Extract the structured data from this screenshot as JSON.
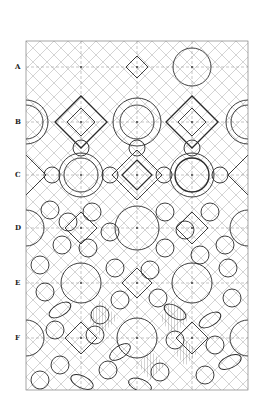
{
  "figure": {
    "row_labels": [
      "A",
      "B",
      "C",
      "D",
      "E",
      "F"
    ],
    "ink_color": "#2a2a2a",
    "grid_color": "#9a9a9a",
    "background": "#ffffff"
  }
}
